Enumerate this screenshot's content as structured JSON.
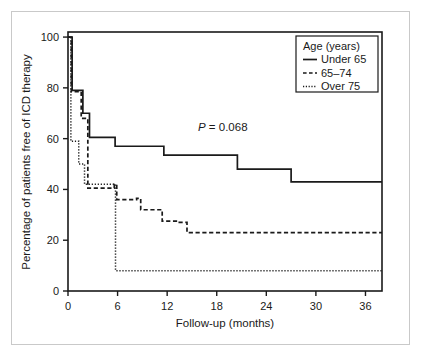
{
  "figure": {
    "background_color": "#ffffff",
    "frame_color": "#c9c9c9",
    "ink_color": "#1a1a1a"
  },
  "annotation": {
    "p_symbol": "P",
    "p_value_text": " = 0.068",
    "full_text": "P = 0.068"
  },
  "legend": {
    "title": "Age (years)",
    "entries": [
      {
        "label": "Under 65",
        "style": "solid"
      },
      {
        "label": "65–74",
        "style": "dashed"
      },
      {
        "label": "Over 75",
        "style": "dotted"
      }
    ]
  },
  "chart_data": {
    "type": "line",
    "subtype": "kaplan-meier-step",
    "title": "",
    "subtitle": "",
    "xlabel": "Follow-up (months)",
    "ylabel": "Percentage of patients free of ICD therapy",
    "xlim": [
      0,
      38
    ],
    "ylim": [
      0,
      102
    ],
    "xticks": [
      0,
      6,
      12,
      18,
      24,
      30,
      36
    ],
    "xtick_labels": [
      "0",
      "6",
      "12",
      "18",
      "24",
      "30",
      "36"
    ],
    "yticks": [
      0,
      20,
      40,
      60,
      80,
      100
    ],
    "ytick_labels": [
      "0",
      "20",
      "40",
      "60",
      "80",
      "100"
    ],
    "grid": false,
    "legend_position": "top-right",
    "annotations": [
      {
        "text": "P = 0.068",
        "x": 16.5,
        "y": 73
      }
    ],
    "series": [
      {
        "name": "Under 65",
        "style": "solid",
        "x": [
          0,
          0.5,
          0.5,
          1.8,
          1.8,
          2.6,
          2.6,
          5.7,
          5.7,
          11.6,
          11.6,
          20.5,
          20.5,
          27.0,
          27.0,
          38.0
        ],
        "y": [
          100,
          100,
          79,
          79,
          70,
          70,
          60.5,
          60.5,
          57,
          57,
          53.5,
          53.5,
          48,
          48,
          43,
          43
        ]
      },
      {
        "name": "65–74",
        "style": "dashed",
        "x": [
          0,
          0.4,
          0.4,
          1.6,
          1.6,
          2.4,
          2.4,
          5.6,
          5.6,
          5.9,
          5.9,
          8.3,
          8.3,
          8.8,
          8.8,
          11.4,
          11.4,
          13.3,
          13.3,
          14.4,
          14.4,
          38.0
        ],
        "y": [
          100,
          100,
          78.5,
          78.5,
          68,
          68,
          40.5,
          40.5,
          42,
          42,
          36,
          36,
          36.5,
          36.5,
          32,
          32,
          27.5,
          27.5,
          27,
          27,
          23,
          23
        ]
      },
      {
        "name": "Over 75",
        "style": "dotted",
        "x": [
          0,
          0.35,
          0.35,
          1.3,
          1.3,
          2.0,
          2.0,
          2.4,
          2.4,
          5.75,
          5.75,
          38.0
        ],
        "y": [
          100,
          100,
          59,
          59,
          50,
          50,
          42,
          42,
          42,
          42,
          8,
          8
        ]
      }
    ]
  }
}
